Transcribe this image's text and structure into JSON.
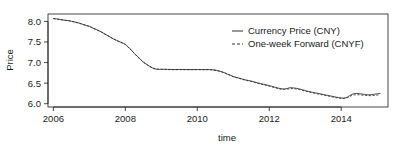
{
  "chart_data": {
    "type": "line",
    "title": "",
    "xlabel": "time",
    "ylabel": "Price",
    "xlim": [
      2005.85,
      2015.3
    ],
    "ylim": [
      5.92,
      8.18
    ],
    "grid": false,
    "legend_position": "top-right-inside",
    "xticks": [
      2006,
      2008,
      2010,
      2012,
      2014
    ],
    "xtick_labels": [
      "2006",
      "2008",
      "2010",
      "2012",
      "2014"
    ],
    "yticks": [
      6.0,
      6.5,
      7.0,
      7.5,
      8.0
    ],
    "ytick_labels": [
      "6.0",
      "6.5",
      "7.0",
      "7.5",
      "8.0"
    ],
    "series": [
      {
        "name": "Currency Price (CNY)",
        "style": "solid",
        "color": "#1a1a1a",
        "x": [
          2006.0,
          2006.08,
          2006.17,
          2006.25,
          2006.33,
          2006.42,
          2006.5,
          2006.58,
          2006.67,
          2006.75,
          2006.83,
          2006.92,
          2007.0,
          2007.08,
          2007.17,
          2007.25,
          2007.33,
          2007.42,
          2007.5,
          2007.58,
          2007.67,
          2007.75,
          2007.83,
          2007.92,
          2008.0,
          2008.08,
          2008.17,
          2008.25,
          2008.33,
          2008.42,
          2008.5,
          2008.58,
          2008.67,
          2008.75,
          2008.83,
          2008.92,
          2009.0,
          2009.17,
          2009.33,
          2009.5,
          2009.67,
          2009.83,
          2010.0,
          2010.17,
          2010.33,
          2010.5,
          2010.58,
          2010.67,
          2010.75,
          2010.83,
          2010.92,
          2011.0,
          2011.08,
          2011.17,
          2011.25,
          2011.33,
          2011.42,
          2011.5,
          2011.58,
          2011.67,
          2011.75,
          2011.83,
          2011.92,
          2012.0,
          2012.08,
          2012.17,
          2012.25,
          2012.33,
          2012.42,
          2012.5,
          2012.58,
          2012.67,
          2012.75,
          2012.83,
          2012.92,
          2013.0,
          2013.08,
          2013.17,
          2013.25,
          2013.33,
          2013.42,
          2013.5,
          2013.58,
          2013.67,
          2013.75,
          2013.83,
          2013.92,
          2014.0,
          2014.08,
          2014.17,
          2014.25,
          2014.33,
          2014.42,
          2014.5,
          2014.58,
          2014.67,
          2014.75,
          2014.83,
          2014.92,
          2015.0,
          2015.08
        ],
        "y": [
          8.07,
          8.062,
          8.05,
          8.035,
          8.028,
          8.02,
          8.005,
          7.99,
          7.97,
          7.95,
          7.925,
          7.9,
          7.88,
          7.845,
          7.81,
          7.78,
          7.745,
          7.7,
          7.66,
          7.62,
          7.575,
          7.54,
          7.51,
          7.48,
          7.44,
          7.38,
          7.3,
          7.22,
          7.15,
          7.08,
          7.01,
          6.96,
          6.91,
          6.87,
          6.845,
          6.835,
          6.838,
          6.835,
          6.83,
          6.832,
          6.83,
          6.828,
          6.83,
          6.828,
          6.83,
          6.82,
          6.8,
          6.78,
          6.755,
          6.72,
          6.69,
          6.66,
          6.64,
          6.62,
          6.6,
          6.58,
          6.565,
          6.55,
          6.53,
          6.51,
          6.49,
          6.475,
          6.46,
          6.44,
          6.42,
          6.4,
          6.38,
          6.365,
          6.355,
          6.37,
          6.39,
          6.385,
          6.375,
          6.36,
          6.34,
          6.32,
          6.3,
          6.285,
          6.27,
          6.255,
          6.24,
          6.225,
          6.21,
          6.195,
          6.18,
          6.165,
          6.15,
          6.14,
          6.13,
          6.16,
          6.205,
          6.24,
          6.25,
          6.245,
          6.235,
          6.225,
          6.215,
          6.22,
          6.23,
          6.24,
          6.25
        ]
      },
      {
        "name": "One-week Forward (CNYF)",
        "style": "dashed",
        "color": "#1a1a1a",
        "x": [
          2006.0,
          2006.17,
          2006.33,
          2006.5,
          2006.67,
          2006.83,
          2007.0,
          2007.17,
          2007.33,
          2007.5,
          2007.67,
          2007.83,
          2008.0,
          2008.17,
          2008.33,
          2008.5,
          2008.67,
          2008.83,
          2009.0,
          2009.33,
          2009.67,
          2010.0,
          2010.33,
          2010.58,
          2010.75,
          2010.92,
          2011.0,
          2011.17,
          2011.33,
          2011.5,
          2011.67,
          2011.83,
          2012.0,
          2012.17,
          2012.33,
          2012.5,
          2012.67,
          2012.83,
          2013.0,
          2013.17,
          2013.33,
          2013.5,
          2013.67,
          2013.83,
          2014.0,
          2014.17,
          2014.33,
          2014.5,
          2014.67,
          2014.83,
          2015.0,
          2015.08
        ],
        "y": [
          8.068,
          8.048,
          8.026,
          8.003,
          7.968,
          7.923,
          7.878,
          7.808,
          7.743,
          7.658,
          7.573,
          7.508,
          7.438,
          7.298,
          7.148,
          7.008,
          6.908,
          6.843,
          6.836,
          6.828,
          6.828,
          6.828,
          6.828,
          6.798,
          6.752,
          6.688,
          6.656,
          6.614,
          6.572,
          6.54,
          6.498,
          6.462,
          6.425,
          6.385,
          6.35,
          6.355,
          6.37,
          6.345,
          6.305,
          6.27,
          6.24,
          6.21,
          6.18,
          6.15,
          6.128,
          6.145,
          6.215,
          6.218,
          6.2,
          6.195,
          6.21,
          6.222
        ]
      }
    ]
  },
  "legend": {
    "items": [
      {
        "label": "Currency Price (CNY)",
        "dash": "solid"
      },
      {
        "label": "One-week Forward (CNYF)",
        "dash": "dashed"
      }
    ]
  }
}
